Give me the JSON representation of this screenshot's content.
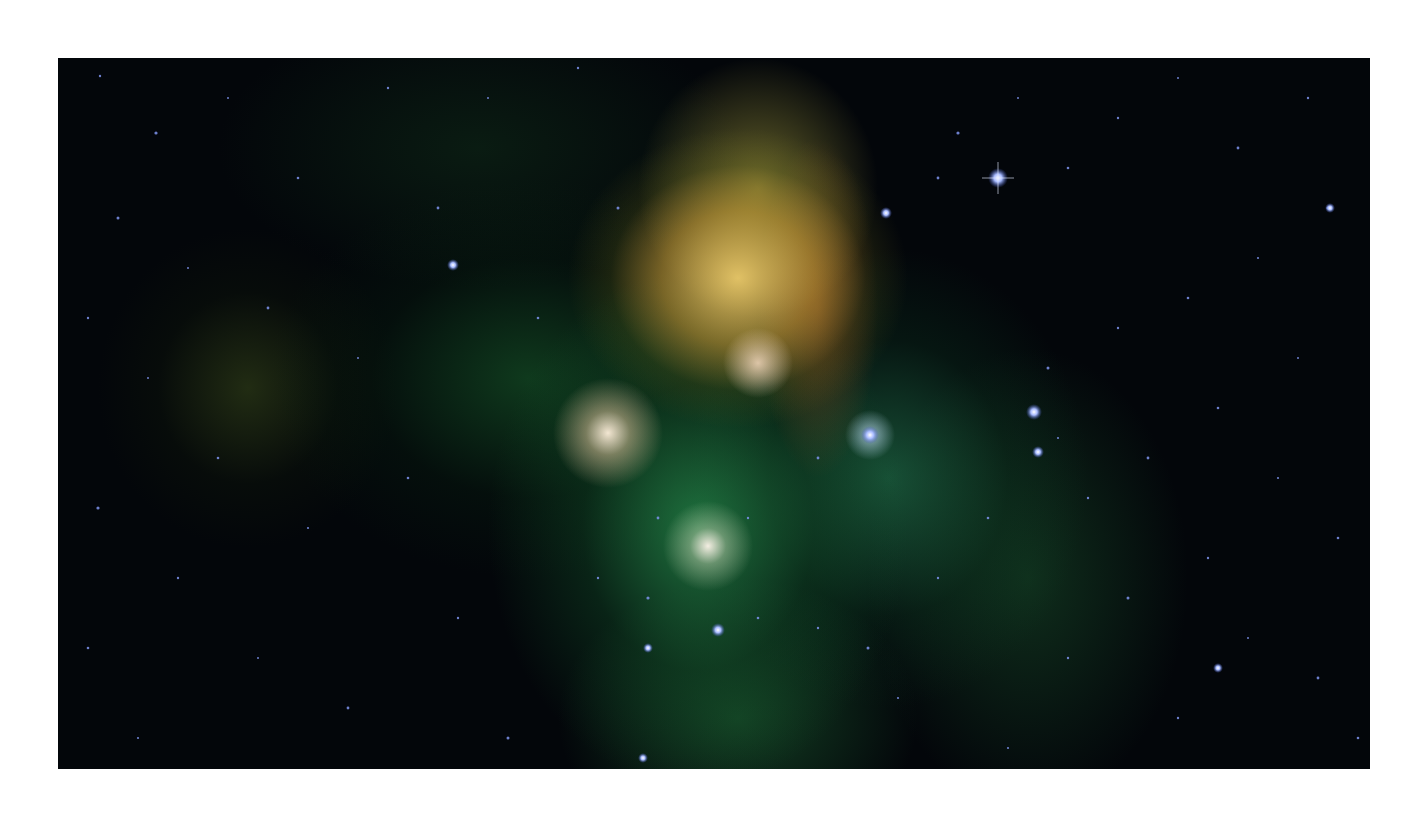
{
  "image": {
    "subject": "infrared nebula star cluster",
    "alt": "Star cluster embedded in glowing green and yellow nebulosity against a dark star field",
    "colors": {
      "page_background": "#ffffff",
      "sky": "#03060a",
      "nebula_green": "#2a9a55",
      "nebula_yellow": "#f0cf6e",
      "star_blue": "#8fa8ff",
      "core_white": "#fff4e6"
    }
  }
}
